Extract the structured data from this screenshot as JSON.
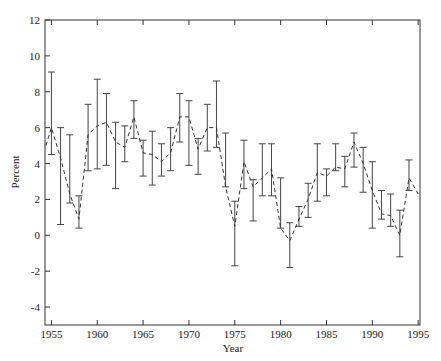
{
  "chart_data": {
    "type": "line",
    "title": "",
    "xlabel": "Year",
    "ylabel": "Percent",
    "xlim": [
      1954.3,
      1995.2
    ],
    "ylim": [
      -5,
      12
    ],
    "grid": false,
    "legend": null,
    "x_ticks": [
      1955,
      1960,
      1965,
      1970,
      1975,
      1980,
      1985,
      1990,
      1995
    ],
    "y_ticks": [
      -4,
      -2,
      0,
      2,
      4,
      6,
      8,
      10,
      12
    ],
    "line_style": "dashed",
    "error_bars": true,
    "series": [
      {
        "name": "Percent",
        "x": [
          1954.4,
          1955,
          1956,
          1957,
          1958,
          1959,
          1960,
          1961,
          1962,
          1963,
          1964,
          1965,
          1966,
          1967,
          1968,
          1969,
          1970,
          1971,
          1972,
          1973,
          1974,
          1975,
          1976,
          1977,
          1978,
          1979,
          1980,
          1981,
          1982,
          1983,
          1984,
          1985,
          1986,
          1987,
          1988,
          1989,
          1990,
          1991,
          1992,
          1993,
          1994,
          1995
        ],
        "values": [
          5.0,
          6.0,
          4.3,
          2.3,
          0.9,
          5.6,
          6.1,
          6.3,
          5.2,
          4.9,
          6.6,
          4.6,
          4.5,
          4.1,
          4.6,
          6.6,
          6.6,
          4.8,
          6.0,
          6.0,
          2.7,
          0.5,
          4.1,
          2.7,
          3.2,
          3.7,
          0.4,
          -0.3,
          0.9,
          2.0,
          3.5,
          3.3,
          3.8,
          3.7,
          5.2,
          4.0,
          2.5,
          1.2,
          1.1,
          0.0,
          3.2,
          2.3
        ],
        "upper": [
          null,
          9.1,
          6.0,
          5.6,
          2.2,
          7.3,
          8.7,
          7.9,
          6.3,
          6.1,
          7.5,
          5.3,
          5.8,
          5.1,
          6.0,
          7.9,
          7.5,
          5.4,
          7.3,
          8.6,
          5.7,
          1.9,
          5.3,
          3.1,
          5.1,
          5.1,
          3.2,
          0.7,
          1.6,
          2.9,
          5.1,
          3.7,
          5.1,
          4.4,
          5.7,
          4.9,
          4.1,
          2.5,
          2.3,
          1.4,
          4.2,
          null
        ],
        "lower": [
          null,
          4.5,
          0.6,
          1.8,
          0.4,
          3.6,
          3.7,
          3.9,
          2.6,
          4.1,
          5.4,
          3.3,
          2.8,
          3.3,
          3.6,
          5.2,
          3.9,
          3.4,
          4.7,
          4.9,
          2.7,
          -1.7,
          2.6,
          0.8,
          2.2,
          2.2,
          0.4,
          -1.8,
          0.5,
          1.0,
          1.9,
          2.2,
          3.6,
          2.7,
          3.8,
          2.4,
          0.4,
          0.9,
          0.5,
          -1.2,
          2.5,
          null
        ]
      }
    ]
  },
  "colors": {
    "axis": "#333333",
    "line": "#333333",
    "errorbar": "#444444",
    "background": "#ffffff"
  }
}
